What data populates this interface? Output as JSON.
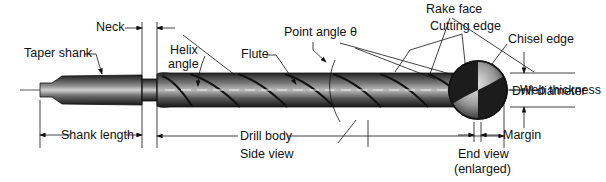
{
  "diagram": {
    "side_view": {
      "caption": "Side view",
      "labels": {
        "neck": "Neck",
        "taper_shank": "Taper shank",
        "helix_angle_1": "Helix",
        "helix_angle_2": "angle",
        "flute": "Flute",
        "point_angle": "Point angle θ",
        "rake_face": "Rake face",
        "drill_diameter": "Drill diameter",
        "shank_length": "Shank length",
        "drill_body": "Drill body"
      }
    },
    "end_view": {
      "caption_1": "End view",
      "caption_2": "(enlarged)",
      "labels": {
        "cutting_edge": "Cutting edge",
        "chisel_edge": "Chisel edge",
        "web_thickness": "Web thickness",
        "margin": "Margin"
      }
    },
    "colors": {
      "ink": "#111111",
      "metal_dark": "#2a2a2a",
      "metal_mid": "#7a7a7a",
      "metal_light": "#d8d8d8"
    }
  }
}
